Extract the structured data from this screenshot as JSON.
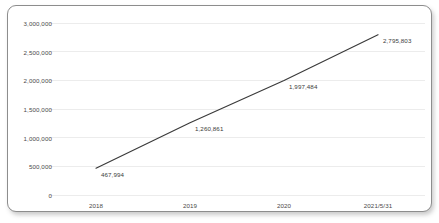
{
  "chart_data": {
    "type": "line",
    "title": "",
    "xlabel": "",
    "ylabel": "",
    "categories": [
      "2018",
      "2019",
      "2020",
      "2021/5/31"
    ],
    "values": [
      467994,
      1260861,
      1997484,
      2795803
    ],
    "point_labels": [
      "467,994",
      "1,260,861",
      "1,997,484",
      "2,795,803"
    ],
    "ylim": [
      0,
      3000000
    ],
    "ytick_values": [
      3000000,
      2500000,
      2000000,
      1500000,
      1000000,
      500000,
      0
    ],
    "ytick_labels": [
      "3,000,000",
      "2,500,000",
      "2,000,000",
      "1,500,000",
      "1,000,000",
      "500,000",
      "0"
    ],
    "grid": true,
    "legend": "none",
    "series": [
      {
        "name": "series-1",
        "values": [
          467994,
          1260861,
          1997484,
          2795803
        ]
      }
    ],
    "colors": {
      "line": "#3a3a3a",
      "gridline": "#ececec",
      "axis_text": "#4a4a4a",
      "label_text": "#3b3b3b",
      "frame_border": "#8d8d8d",
      "background": "#ffffff"
    }
  }
}
